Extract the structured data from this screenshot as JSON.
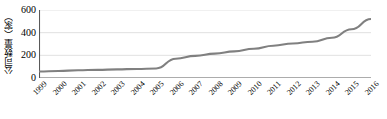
{
  "chart_data": {
    "type": "line",
    "title": "",
    "xlabel": "",
    "ylabel": "公司数量（家）",
    "categories": [
      "1999",
      "2000",
      "2001",
      "2002",
      "2003",
      "2004",
      "2005",
      "2006",
      "2007",
      "2008",
      "2009",
      "2010",
      "2011",
      "2012",
      "2013",
      "2014",
      "2015",
      "2016"
    ],
    "values": [
      58,
      62,
      68,
      72,
      76,
      80,
      84,
      170,
      195,
      215,
      235,
      258,
      285,
      305,
      320,
      355,
      430,
      520
    ],
    "series": [
      {
        "name": "公司数量（家）",
        "values": [
          58,
          62,
          68,
          72,
          76,
          80,
          84,
          170,
          195,
          215,
          235,
          258,
          285,
          305,
          320,
          355,
          430,
          520
        ]
      }
    ],
    "ylim": [
      0,
      600
    ],
    "yticks": [
      0,
      200,
      400,
      600
    ],
    "ytick_labels": [
      "0",
      "200",
      "400",
      "600"
    ],
    "grid": true,
    "grid_axis": "y",
    "legend": false,
    "line_color": "#808080",
    "grid_color": "#d9d9d9",
    "axis_color": "#595959"
  }
}
